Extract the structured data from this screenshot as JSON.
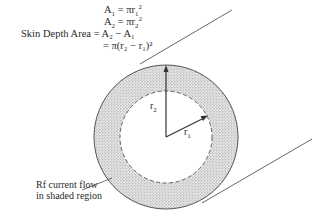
{
  "equations": [
    {
      "lhs": "A",
      "lhs_sub": "1",
      "rhs": "= πr",
      "rhs_sub": "1",
      "rhs_sup": "2"
    },
    {
      "lhs": "A",
      "lhs_sub": "2",
      "rhs": "= πr",
      "rhs_sub": "2",
      "rhs_sup": "2"
    },
    {
      "lhs_text": "Skin Depth Area",
      "rhs_text": "= A₂ − A₁"
    },
    {
      "rhs_text": "= π(r₂ − r₁)²"
    }
  ],
  "labels": {
    "r2": "r",
    "r2_sub": "2",
    "r1": "r",
    "r1_sub": "1"
  },
  "callout": {
    "line1": "Rf current flow",
    "line2": "in shaded region"
  },
  "geometry": {
    "center": [
      166,
      137
    ],
    "outer_radius": 72,
    "inner_radius": 46,
    "stroke_color": "#555555",
    "shade_color": "#c9c9c9"
  }
}
